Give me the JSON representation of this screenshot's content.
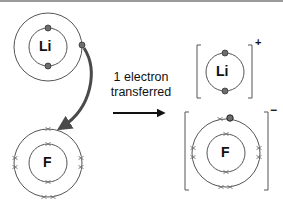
{
  "figure": {
    "caption_line1": "1 electron",
    "caption_line2": "transferred",
    "before": {
      "lithium": {
        "symbol": "Li",
        "shells": 2,
        "inner_electrons": 2,
        "outer_electrons": 1
      },
      "fluorine": {
        "symbol": "F",
        "shells": 2,
        "inner_electrons": 2,
        "outer_electrons": 7
      }
    },
    "after": {
      "lithium_ion": {
        "symbol": "Li",
        "charge": "+",
        "shells": 1,
        "electrons": 2
      },
      "fluoride_ion": {
        "symbol": "F",
        "charge": "−",
        "shells": 2,
        "inner_electrons": 2,
        "outer_electrons": 8,
        "transferred_electrons": 1
      }
    },
    "colors": {
      "line": "#555555",
      "arrow": "#4a4a4a",
      "electron_fill": "#6d6d6d",
      "cross": "#7a7a7a",
      "text": "#111111"
    }
  }
}
